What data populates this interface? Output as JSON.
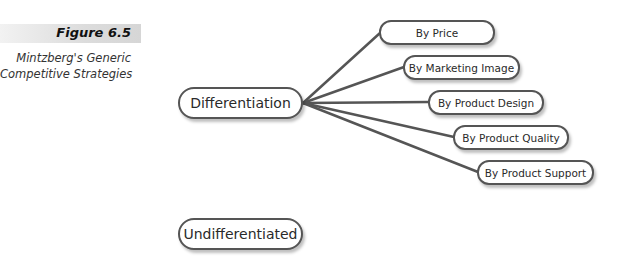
{
  "figure": {
    "label": "Figure 6.5",
    "caption_lines": [
      "Mintzberg's Generic",
      "Competitive Strategies"
    ]
  },
  "diagram": {
    "nodes": {
      "differentiation": "Differentiation",
      "undifferentiated": "Undifferentiated"
    },
    "branches": [
      "By Price",
      "By Marketing Image",
      "By Product Design",
      "By Product Quality",
      "By Product Support"
    ]
  },
  "colors": {
    "line": "#555555",
    "border": "#555555",
    "band": "#dcdcdc"
  }
}
